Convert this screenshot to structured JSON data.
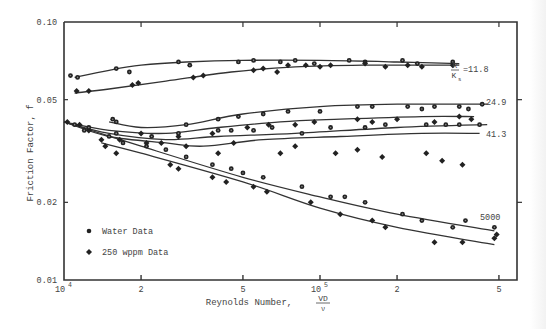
{
  "chart_data": {
    "type": "line",
    "title": "",
    "xlabel": "Reynolds Number, VD/ν",
    "xlabel_main": "Reynolds Number,",
    "xlabel_frac_num": "VD",
    "xlabel_frac_den": "ν",
    "ylabel": "Friction Factor, f",
    "xscale": "log",
    "yscale": "log",
    "xlim": [
      10000,
      550000
    ],
    "ylim": [
      0.01,
      0.1
    ],
    "grid": false,
    "x_ticks": [
      {
        "value": 10000,
        "label": "10",
        "sup": "4"
      },
      {
        "value": 20000,
        "label": "2",
        "sup": ""
      },
      {
        "value": 50000,
        "label": "5",
        "sup": ""
      },
      {
        "value": 100000,
        "label": "10",
        "sup": "5"
      },
      {
        "value": 200000,
        "label": "2",
        "sup": ""
      },
      {
        "value": 500000,
        "label": "5",
        "sup": ""
      }
    ],
    "y_ticks": [
      {
        "value": 0.1,
        "label": "0.10"
      },
      {
        "value": 0.05,
        "label": "0.05"
      },
      {
        "value": 0.02,
        "label": "0.02"
      },
      {
        "value": 0.01,
        "label": "0.01"
      }
    ],
    "legend": {
      "position": "lower-left",
      "entries": [
        {
          "label": "Water Data",
          "marker": "circle"
        },
        {
          "label": "250 wppm Data",
          "marker": "diamond"
        }
      ]
    },
    "curve_labels": {
      "ratio_num": "R",
      "ratio_den": "K",
      "ratio_sub": "s",
      "labels": [
        "=11.8",
        "24.9",
        "41.3",
        "5000"
      ]
    },
    "series": [
      {
        "name": "R/Ks=11.8 Water",
        "marker": "circle",
        "curve": [
          [
            11000,
            0.061
          ],
          [
            15000,
            0.065
          ],
          [
            20000,
            0.068
          ],
          [
            30000,
            0.07
          ],
          [
            50000,
            0.071
          ],
          [
            100000,
            0.071
          ],
          [
            200000,
            0.07
          ],
          [
            350000,
            0.069
          ]
        ],
        "points": [
          [
            10600,
            0.062
          ],
          [
            11300,
            0.061
          ],
          [
            16000,
            0.066
          ],
          [
            18000,
            0.064
          ],
          [
            28000,
            0.07
          ],
          [
            31000,
            0.068
          ],
          [
            48000,
            0.07
          ],
          [
            55000,
            0.071
          ],
          [
            70000,
            0.07
          ],
          [
            80000,
            0.071
          ],
          [
            95000,
            0.069
          ],
          [
            130000,
            0.071
          ],
          [
            150000,
            0.07
          ],
          [
            210000,
            0.071
          ],
          [
            240000,
            0.069
          ],
          [
            330000,
            0.07
          ]
        ]
      },
      {
        "name": "R/Ks=11.8 250 wppm",
        "marker": "diamond",
        "curve": [
          [
            11000,
            0.053
          ],
          [
            15000,
            0.055
          ],
          [
            25000,
            0.059
          ],
          [
            45000,
            0.064
          ],
          [
            80000,
            0.067
          ],
          [
            150000,
            0.068
          ],
          [
            350000,
            0.068
          ]
        ],
        "points": [
          [
            11200,
            0.054
          ],
          [
            12500,
            0.054
          ],
          [
            18500,
            0.057
          ],
          [
            19500,
            0.058
          ],
          [
            32000,
            0.061
          ],
          [
            35000,
            0.062
          ],
          [
            55000,
            0.065
          ],
          [
            60000,
            0.066
          ],
          [
            68000,
            0.064
          ],
          [
            75000,
            0.068
          ],
          [
            88000,
            0.068
          ],
          [
            100000,
            0.067
          ],
          [
            110000,
            0.068
          ],
          [
            150000,
            0.069
          ],
          [
            180000,
            0.067
          ],
          [
            220000,
            0.068
          ],
          [
            250000,
            0.067
          ],
          [
            330000,
            0.068
          ]
        ]
      },
      {
        "name": "R/Ks=24.9 Water",
        "marker": "circle",
        "curve": [
          [
            15000,
            0.041
          ],
          [
            20000,
            0.039
          ],
          [
            30000,
            0.04
          ],
          [
            50000,
            0.044
          ],
          [
            100000,
            0.047
          ],
          [
            200000,
            0.048
          ],
          [
            450000,
            0.048
          ]
        ],
        "points": [
          [
            15500,
            0.042
          ],
          [
            16000,
            0.041
          ],
          [
            30000,
            0.04
          ],
          [
            40000,
            0.042
          ],
          [
            48000,
            0.043
          ],
          [
            60000,
            0.044
          ],
          [
            75000,
            0.045
          ],
          [
            100000,
            0.045
          ],
          [
            140000,
            0.047
          ],
          [
            160000,
            0.047
          ],
          [
            220000,
            0.047
          ],
          [
            250000,
            0.046
          ],
          [
            280000,
            0.047
          ],
          [
            350000,
            0.047
          ],
          [
            380000,
            0.046
          ],
          [
            430000,
            0.048
          ]
        ]
      },
      {
        "name": "R/Ks=24.9 250 wppm",
        "marker": "diamond",
        "curve": [
          [
            10000,
            0.041
          ],
          [
            15000,
            0.038
          ],
          [
            25000,
            0.037
          ],
          [
            40000,
            0.039
          ],
          [
            70000,
            0.041
          ],
          [
            120000,
            0.042
          ],
          [
            250000,
            0.043
          ],
          [
            400000,
            0.043
          ]
        ],
        "points": [
          [
            10300,
            0.041
          ],
          [
            11500,
            0.04
          ],
          [
            12500,
            0.038
          ],
          [
            20000,
            0.037
          ],
          [
            28000,
            0.036
          ],
          [
            38000,
            0.037
          ],
          [
            52000,
            0.039
          ],
          [
            63000,
            0.04
          ],
          [
            80000,
            0.04
          ],
          [
            95000,
            0.041
          ],
          [
            140000,
            0.042
          ],
          [
            160000,
            0.041
          ],
          [
            200000,
            0.042
          ],
          [
            280000,
            0.041
          ],
          [
            350000,
            0.043
          ],
          [
            390000,
            0.042
          ]
        ]
      },
      {
        "name": "R/Ks=41.3 Water",
        "marker": "circle",
        "curve": [
          [
            10000,
            0.041
          ],
          [
            15000,
            0.037
          ],
          [
            25000,
            0.035
          ],
          [
            40000,
            0.036
          ],
          [
            80000,
            0.037
          ],
          [
            200000,
            0.039
          ],
          [
            450000,
            0.04
          ]
        ],
        "points": [
          [
            12000,
            0.038
          ],
          [
            16000,
            0.037
          ],
          [
            22000,
            0.036
          ],
          [
            28000,
            0.037
          ],
          [
            40000,
            0.038
          ],
          [
            45000,
            0.038
          ],
          [
            55000,
            0.038
          ],
          [
            65000,
            0.039
          ],
          [
            85000,
            0.037
          ],
          [
            110000,
            0.039
          ],
          [
            150000,
            0.039
          ],
          [
            180000,
            0.04
          ],
          [
            260000,
            0.04
          ],
          [
            310000,
            0.04
          ],
          [
            350000,
            0.04
          ],
          [
            420000,
            0.04
          ]
        ]
      },
      {
        "name": "R/Ks=41.3 250 wppm",
        "marker": "diamond",
        "curve": [
          [
            10000,
            0.041
          ],
          [
            15000,
            0.036
          ],
          [
            25000,
            0.034
          ],
          [
            35000,
            0.033
          ],
          [
            60000,
            0.035
          ],
          [
            120000,
            0.036
          ],
          [
            250000,
            0.037
          ],
          [
            420000,
            0.037
          ]
        ],
        "points": [
          [
            14000,
            0.035
          ],
          [
            16500,
            0.035
          ],
          [
            21000,
            0.034
          ],
          [
            24000,
            0.034
          ],
          [
            30000,
            0.033
          ],
          [
            40000,
            0.031
          ],
          [
            46000,
            0.034
          ],
          [
            70000,
            0.031
          ],
          [
            80000,
            0.033
          ],
          [
            115000,
            0.031
          ],
          [
            140000,
            0.032
          ],
          [
            175000,
            0.03
          ],
          [
            260000,
            0.031
          ],
          [
            300000,
            0.029
          ],
          [
            360000,
            0.028
          ]
        ]
      },
      {
        "name": "R/Ks=5000 Water",
        "marker": "circle",
        "curve": [
          [
            10000,
            0.041
          ],
          [
            20000,
            0.033
          ],
          [
            50000,
            0.025
          ],
          [
            100000,
            0.021
          ],
          [
            200000,
            0.018
          ],
          [
            480000,
            0.0155
          ]
        ],
        "points": [
          [
            11000,
            0.04
          ],
          [
            12500,
            0.039
          ],
          [
            15000,
            0.036
          ],
          [
            17000,
            0.034
          ],
          [
            21000,
            0.033
          ],
          [
            25000,
            0.032
          ],
          [
            30000,
            0.03
          ],
          [
            38000,
            0.028
          ],
          [
            45000,
            0.027
          ],
          [
            50000,
            0.026
          ],
          [
            60000,
            0.025
          ],
          [
            85000,
            0.023
          ],
          [
            110000,
            0.021
          ],
          [
            125000,
            0.021
          ],
          [
            150000,
            0.02
          ],
          [
            210000,
            0.018
          ],
          [
            250000,
            0.017
          ],
          [
            330000,
            0.016
          ],
          [
            370000,
            0.017
          ],
          [
            480000,
            0.016
          ]
        ]
      },
      {
        "name": "R/Ks=5000 250 wppm",
        "marker": "diamond",
        "curve": [
          [
            14000,
            0.034
          ],
          [
            20000,
            0.031
          ],
          [
            50000,
            0.024
          ],
          [
            100000,
            0.019
          ],
          [
            200000,
            0.016
          ],
          [
            480000,
            0.0137
          ]
        ],
        "points": [
          [
            14500,
            0.033
          ],
          [
            16000,
            0.031
          ],
          [
            26000,
            0.028
          ],
          [
            28000,
            0.027
          ],
          [
            38000,
            0.025
          ],
          [
            43000,
            0.024
          ],
          [
            55000,
            0.023
          ],
          [
            62000,
            0.022
          ],
          [
            92000,
            0.02
          ],
          [
            120000,
            0.018
          ],
          [
            160000,
            0.017
          ],
          [
            180000,
            0.016
          ],
          [
            280000,
            0.014
          ],
          [
            360000,
            0.014
          ],
          [
            480000,
            0.0145
          ],
          [
            490000,
            0.015
          ]
        ]
      }
    ]
  },
  "axis": {
    "ylabel": "Friction Factor, f",
    "xlabel_main": "Reynolds Number,",
    "xlabel_frac_num": "VD",
    "xlabel_frac_den": "ν"
  },
  "legend": {
    "water": "Water Data",
    "polymer": "250 wppm Data"
  }
}
